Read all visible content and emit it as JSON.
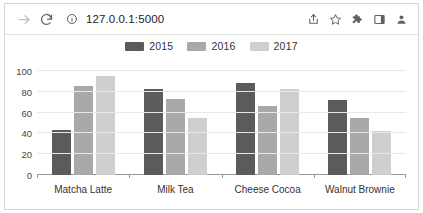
{
  "browser": {
    "url": "127.0.0.1:5000",
    "icons": {
      "forward": "forward-arrow-icon",
      "reload": "reload-icon",
      "info": "info-circle-icon",
      "share": "share-icon",
      "bookmark": "star-icon",
      "extensions": "puzzle-piece-icon",
      "panel": "side-panel-icon",
      "profile": "profile-avatar-icon"
    }
  },
  "chart_data": {
    "type": "bar",
    "title": "",
    "xlabel": "",
    "ylabel": "",
    "ylim": [
      0,
      100
    ],
    "yticks": [
      0,
      20,
      40,
      60,
      80,
      100
    ],
    "grid": true,
    "legend_position": "top",
    "categories": [
      "Matcha Latte",
      "Milk Tea",
      "Cheese Cocoa",
      "Walnut Brownie"
    ],
    "series": [
      {
        "name": "2015",
        "color": "#5b5b5b",
        "values": [
          43,
          83,
          88,
          72
        ]
      },
      {
        "name": "2016",
        "color": "#a9a9a9",
        "values": [
          86,
          73,
          66,
          55
        ]
      },
      {
        "name": "2017",
        "color": "#cfcfcf",
        "values": [
          95,
          55,
          83,
          42
        ]
      }
    ]
  }
}
